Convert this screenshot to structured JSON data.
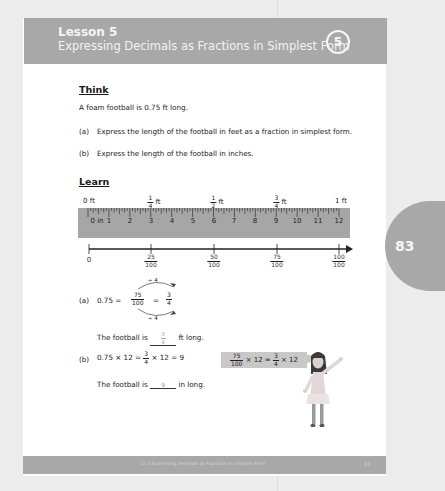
{
  "header": {
    "lesson_number": "Lesson 5",
    "lesson_title": "Expressing Decimals as Fractions in Simplest Form",
    "badge": "5"
  },
  "side_tab": {
    "page": "83"
  },
  "think": {
    "heading": "Think",
    "problem": "A foam football is 0.75 ft long.",
    "part_a_label": "(a)",
    "part_a": "Express the length of the football in feet as a fraction in simplest form.",
    "part_b_label": "(b)",
    "part_b": "Express the length of the football in inches."
  },
  "learn": {
    "heading": "Learn",
    "ft_labels": [
      {
        "num": "",
        "den": "",
        "text": "0 ft"
      },
      {
        "num": "1",
        "den": "4",
        "text": "ft"
      },
      {
        "num": "1",
        "den": "2",
        "text": "ft"
      },
      {
        "num": "3",
        "den": "4",
        "text": "ft"
      },
      {
        "num": "",
        "den": "",
        "text": "1 ft"
      }
    ],
    "inch_labels": [
      "0 in",
      "1",
      "2",
      "3",
      "4",
      "5",
      "6",
      "7",
      "8",
      "9",
      "10",
      "11",
      "12"
    ],
    "number_line": [
      {
        "num": "0",
        "den": ""
      },
      {
        "num": "25",
        "den": "100"
      },
      {
        "num": "50",
        "den": "100"
      },
      {
        "num": "75",
        "den": "100"
      },
      {
        "num": "100",
        "den": "100"
      }
    ],
    "part_a": {
      "label": "(a)",
      "decimal": "0.75 =",
      "frac1_num": "75",
      "frac1_den": "100",
      "equals": "=",
      "frac2_num": "3",
      "frac2_den": "4",
      "top_arrow": "÷ 4",
      "bottom_arrow": "÷ 4",
      "answer_prefix": "The football is",
      "answer_num": "3",
      "answer_den": "4",
      "answer_suffix": "ft long."
    },
    "part_b": {
      "label": "(b)",
      "eq_start": "0.75 × 12 =",
      "frac_num": "3",
      "frac_den": "4",
      "eq_end": "× 12 = 9",
      "answer_prefix": "The football is",
      "answer": "9",
      "answer_suffix": "in long."
    },
    "speech_bubble": {
      "frac1_num": "75",
      "frac1_den": "100",
      "mid": "× 12 =",
      "frac2_num": "3",
      "frac2_den": "4",
      "end": "× 12"
    }
  },
  "footer": {
    "text": "12.5  Expressing Decimals as Fractions in Simplest Form",
    "page": "83"
  },
  "colors": {
    "header_gray": "#a8a8a8",
    "bubble_gray": "#c8c8c8",
    "page_bg": "#ffffff"
  }
}
